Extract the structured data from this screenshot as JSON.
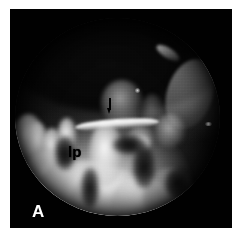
{
  "figure": {
    "panel_letter": "A",
    "modality": "endoscopic-grayscale-photograph",
    "frame_background_color": "#010101",
    "page_background_color": "#ffffff"
  },
  "annotations": {
    "tissue_label": "lp",
    "tissue_label_color": "#000000",
    "panel_letter_color": "#ffffff",
    "arrow_marker_color": "#000000",
    "arrow_marker_name": "down-arrow-marker"
  },
  "field_of_view": {
    "shape": "circle",
    "aperture_name": "endoscope-aperture",
    "illumination": "bright-lower-left",
    "highlight_color": "#ffffff",
    "shadow_color": "#050505"
  },
  "structures": {
    "blade_name": "instrument-blade-highlight",
    "streak_name": "specular-streak",
    "tissue_group_name": "tissue-projections"
  }
}
